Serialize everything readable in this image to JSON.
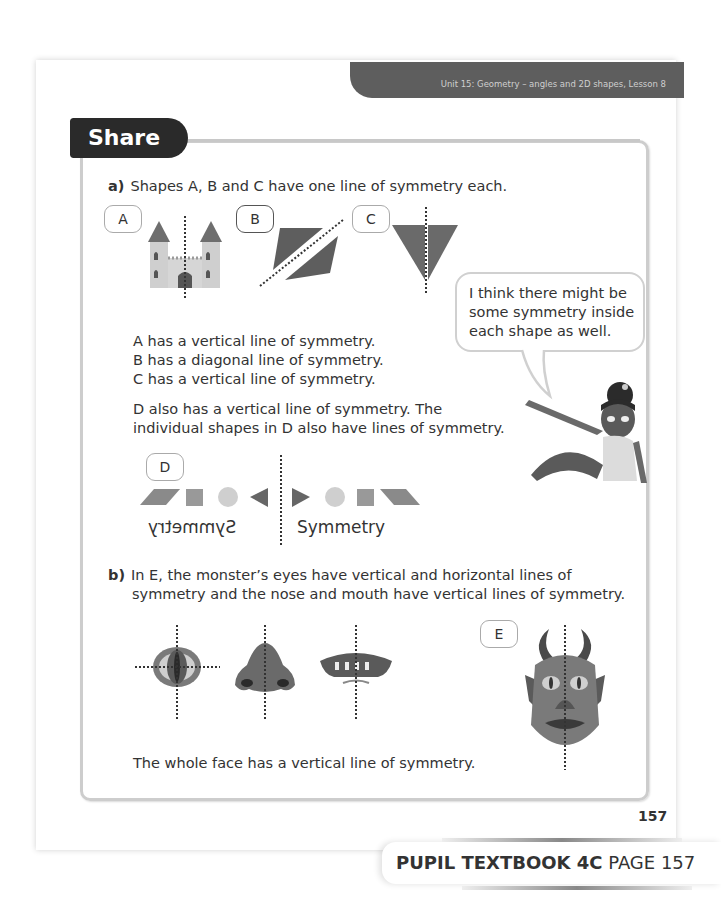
{
  "header": {
    "unit_banner": "Unit 15: Geometry – angles and 2D shapes, Lesson 8"
  },
  "section": {
    "title": "Share"
  },
  "part_a": {
    "label": "a)",
    "intro": "Shapes A, B and C have one line of symmetry each.",
    "shape_tags": [
      "A",
      "B",
      "C"
    ],
    "statements": [
      "A has a vertical line of symmetry.",
      "B has a diagonal line of symmetry.",
      "C has a vertical line of symmetry."
    ],
    "d_text_line1": "D also has a vertical line of symmetry. The",
    "d_text_line2": "individual shapes in D also have lines of symmetry.",
    "d_tag": "D",
    "d_word": "Symmetry",
    "d_word_mirrored": "Symmetry"
  },
  "speech_bubble": {
    "lines": [
      "I think there might be",
      "some symmetry inside",
      "each shape as well."
    ]
  },
  "part_b": {
    "label": "b)",
    "line1": "In E, the monster’s eyes have vertical and horizontal lines of",
    "line2": "symmetry and the nose and mouth have vertical lines of symmetry.",
    "e_tag": "E",
    "conclusion": "The whole face has a vertical line of symmetry."
  },
  "footer": {
    "page_number": "157",
    "book_label": "PUPIL TEXTBOOK 4C",
    "page_label": "PAGE 157"
  },
  "colors": {
    "banner": "#5e5e5e",
    "share_tab": "#2a2a2a",
    "shape_dark": "#6a6a6a",
    "shape_light": "#c8c8c8"
  }
}
